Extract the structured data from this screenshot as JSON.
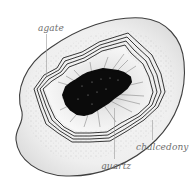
{
  "diagram": {
    "labels": {
      "agate": "agate",
      "chalcedony": "chalcedony",
      "quartz": "quartz"
    },
    "colors": {
      "outline": "#444444",
      "crystal_core": "#0a0a0a",
      "label_text": "#6f6f6f",
      "leader_line": "#9a9a9a",
      "fill_light": "#f2f2f2",
      "speckle": "#7a7a7a"
    }
  }
}
